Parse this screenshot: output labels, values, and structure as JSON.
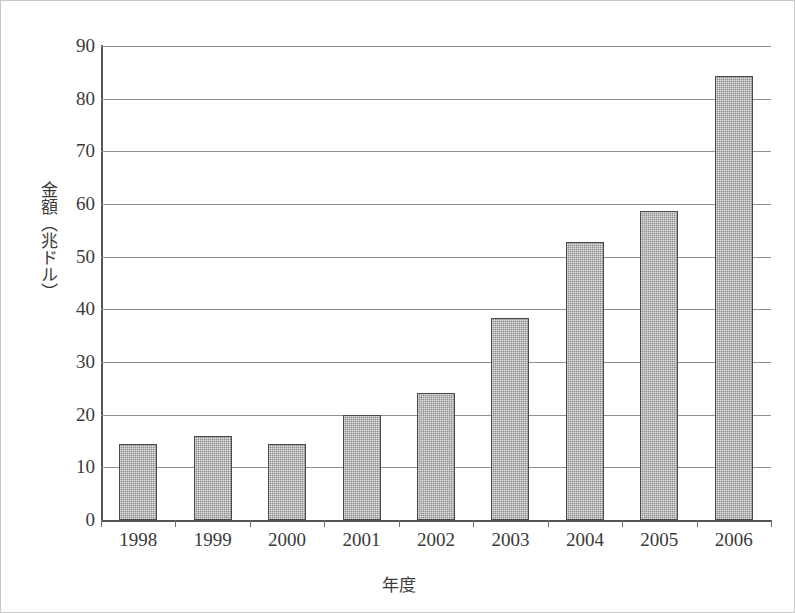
{
  "chart_data": {
    "type": "bar",
    "title": "",
    "xlabel": "年度",
    "ylabel": "金額（兆ドル）",
    "categories": [
      "1998",
      "1999",
      "2000",
      "2001",
      "2002",
      "2003",
      "2004",
      "2005",
      "2006"
    ],
    "values": [
      14.5,
      15.9,
      14.5,
      20.0,
      24.2,
      38.4,
      52.7,
      58.6,
      84.4
    ],
    "ylim": [
      0,
      90
    ],
    "ytick_values": [
      0,
      10,
      20,
      30,
      40,
      50,
      60,
      70,
      80,
      90
    ],
    "ytick_labels": [
      "0",
      "10",
      "20",
      "30",
      "40",
      "50",
      "60",
      "70",
      "80",
      "90"
    ],
    "grid": true,
    "grid_axis": "y",
    "legend": false,
    "legend_position": "none",
    "series": [
      {
        "name": "金額",
        "values": [
          14.5,
          15.9,
          14.5,
          20.0,
          24.2,
          38.4,
          52.7,
          58.6,
          84.4
        ]
      }
    ],
    "bar_fill_color": "#8d8d8d",
    "bar_border_color": "#4a4a4a",
    "grid_color": "#8f8f8f",
    "axis_color": "#555555",
    "background_color": "#ffffff",
    "text_color": "#3a3a3a"
  }
}
